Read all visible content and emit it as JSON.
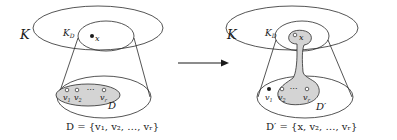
{
  "figure": {
    "left": {
      "outer_label": "K",
      "disc_label": "K",
      "disc_sub": "D",
      "point_label": "x",
      "vertices": [
        {
          "label": "v",
          "sub": "1"
        },
        {
          "label": "v",
          "sub": "2"
        },
        {
          "label": "v",
          "sub": "r"
        }
      ],
      "ellipsis": "⋯",
      "set_label": "D",
      "caption": "D = {v₁, v₂, …, vᵣ}"
    },
    "arrow": {
      "direction": "right"
    },
    "right": {
      "outer_label": "K",
      "disc_label": "K",
      "disc_sub": "D",
      "point_label": "x",
      "vertices": [
        {
          "label": "v",
          "sub": "1"
        },
        {
          "label": "v",
          "sub": "2"
        },
        {
          "label": "v",
          "sub": "r"
        }
      ],
      "ellipsis": "⋯",
      "set_label": "D′",
      "caption": "D′ = {x, v₂, …, vᵣ}"
    },
    "colors": {
      "line": "#2a2a2a",
      "fill_gray": "#d4d4d4",
      "background": "#ffffff"
    }
  }
}
